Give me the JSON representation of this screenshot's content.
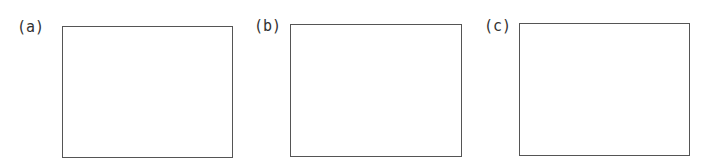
{
  "panels": [
    {
      "label": "(a)"
    },
    {
      "label": "(b)"
    },
    {
      "label": "(c)"
    }
  ],
  "colors": {
    "border": "#555555",
    "text": "#333333",
    "background": "#ffffff"
  }
}
